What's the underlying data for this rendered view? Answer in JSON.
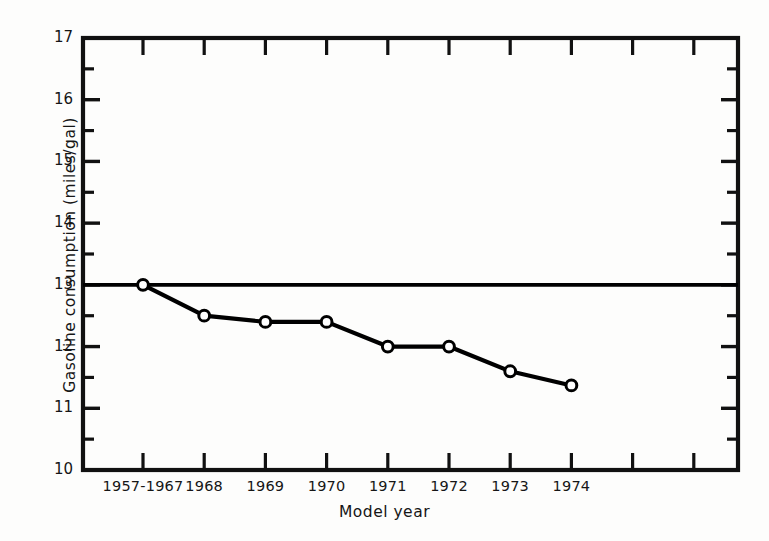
{
  "chart_data": {
    "type": "line",
    "title": "",
    "xlabel": "Model year",
    "ylabel": "Gasoline consumption (miles/gal)",
    "categories": [
      "1957-1967",
      "1968",
      "1969",
      "1970",
      "1971",
      "1972",
      "1973",
      "1974"
    ],
    "values": [
      13.0,
      12.5,
      12.4,
      12.4,
      12.0,
      12.0,
      11.6,
      11.37
    ],
    "series": [
      {
        "name": "Gasoline consumption",
        "values": [
          13.0,
          12.5,
          12.4,
          12.4,
          12.0,
          12.0,
          11.6,
          11.37
        ],
        "marker": "open-circle",
        "color": "#000000"
      }
    ],
    "reference_lines": [
      {
        "name": "baseline-13",
        "orientation": "horizontal",
        "value": 13.0,
        "color": "#000000"
      }
    ],
    "ylim": [
      10,
      17
    ],
    "ytick_labels": [
      "17",
      "16",
      "15",
      "14",
      "13",
      "12",
      "11",
      "10"
    ],
    "ytick_values": [
      17,
      16,
      15,
      14,
      13,
      12,
      11,
      10
    ],
    "yminor_values": [
      16.5,
      15.5,
      14.5,
      13.5,
      12.5,
      11.5,
      10.5
    ],
    "xtick_count": 11,
    "xtick_labels": [
      "1957-1967",
      "1968",
      "1969",
      "1970",
      "1971",
      "1972",
      "1973",
      "1974"
    ],
    "grid": false,
    "legend": "none",
    "axis_color": "#111111",
    "background": "#fdfdfc"
  }
}
